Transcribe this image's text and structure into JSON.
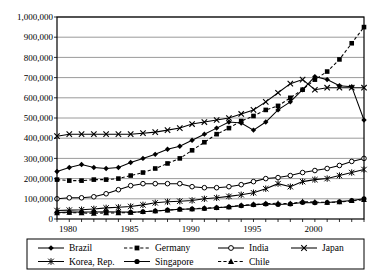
{
  "chart_data": {
    "type": "line",
    "title": "",
    "xlabel": "",
    "ylabel": "",
    "xlim": [
      1980,
      2005
    ],
    "ylim": [
      0,
      1000000
    ],
    "grid": true,
    "legend_position": "bottom",
    "x": [
      1980,
      1981,
      1982,
      1983,
      1984,
      1985,
      1986,
      1987,
      1988,
      1989,
      1990,
      1991,
      1992,
      1993,
      1994,
      1995,
      1996,
      1997,
      1998,
      1999,
      2000,
      2001,
      2002,
      2003,
      2004,
      2005
    ],
    "xtick_labels": [
      "1980",
      "1985",
      "1990",
      "1995",
      "2000"
    ],
    "xtick_values": [
      1980,
      1985,
      1990,
      1995,
      2000
    ],
    "ytick_labels": [
      "0",
      "100,000",
      "200,000",
      "300,000",
      "400,000",
      "500,000",
      "600,000",
      "700,000",
      "800,000",
      "900,000",
      "1,000,000"
    ],
    "ytick_values": [
      0,
      100000,
      200000,
      300000,
      400000,
      500000,
      600000,
      700000,
      800000,
      900000,
      1000000
    ],
    "series": [
      {
        "name": "Brazil",
        "marker": "diamond",
        "dash": "solid",
        "values": [
          235000,
          255000,
          270000,
          255000,
          250000,
          255000,
          280000,
          300000,
          320000,
          345000,
          360000,
          390000,
          420000,
          450000,
          480000,
          475000,
          440000,
          480000,
          540000,
          580000,
          640000,
          705000,
          690000,
          660000,
          655000,
          490000
        ]
      },
      {
        "name": "Germany",
        "marker": "square",
        "dash": "dashed",
        "values": [
          195000,
          190000,
          190000,
          195000,
          195000,
          200000,
          215000,
          230000,
          250000,
          275000,
          300000,
          340000,
          380000,
          420000,
          450000,
          485000,
          510000,
          540000,
          560000,
          600000,
          640000,
          690000,
          730000,
          790000,
          870000,
          950000
        ]
      },
      {
        "name": "India",
        "marker": "circle-open",
        "dash": "solid",
        "values": [
          100000,
          105000,
          105000,
          110000,
          125000,
          145000,
          165000,
          175000,
          175000,
          175000,
          175000,
          160000,
          155000,
          155000,
          160000,
          170000,
          185000,
          200000,
          205000,
          215000,
          230000,
          240000,
          250000,
          265000,
          285000,
          300000
        ]
      },
      {
        "name": "Japan",
        "marker": "x",
        "dash": "solid",
        "values": [
          410000,
          420000,
          420000,
          420000,
          420000,
          420000,
          420000,
          425000,
          430000,
          440000,
          450000,
          470000,
          480000,
          490000,
          500000,
          520000,
          540000,
          580000,
          625000,
          670000,
          690000,
          640000,
          650000,
          650000,
          650000,
          650000
        ]
      },
      {
        "name": "Korea, Rep.",
        "marker": "star",
        "dash": "solid",
        "values": [
          42000,
          44000,
          46000,
          50000,
          55000,
          58000,
          62000,
          70000,
          80000,
          85000,
          88000,
          92000,
          100000,
          105000,
          112000,
          120000,
          130000,
          150000,
          175000,
          160000,
          185000,
          195000,
          200000,
          215000,
          230000,
          245000
        ]
      },
      {
        "name": "Singapore",
        "marker": "circle-filled",
        "dash": "solid",
        "values": [
          32000,
          34000,
          35000,
          35000,
          36000,
          35000,
          34000,
          36000,
          40000,
          44000,
          48000,
          50000,
          52000,
          56000,
          60000,
          66000,
          70000,
          74000,
          72000,
          74000,
          82000,
          80000,
          82000,
          86000,
          92000,
          100000
        ]
      },
      {
        "name": "Chile",
        "marker": "triangle",
        "dash": "dashed",
        "values": [
          30000,
          32000,
          30000,
          28000,
          30000,
          30000,
          32000,
          36000,
          40000,
          44000,
          48000,
          50000,
          54000,
          56000,
          60000,
          68000,
          72000,
          76000,
          78000,
          76000,
          86000,
          84000,
          82000,
          84000,
          90000,
          95000
        ]
      }
    ]
  },
  "legend": {
    "entries": [
      {
        "label": "Brazil"
      },
      {
        "label": "Germany"
      },
      {
        "label": "India"
      },
      {
        "label": "Japan"
      },
      {
        "label": "Korea, Rep."
      },
      {
        "label": "Singapore"
      },
      {
        "label": "Chile"
      }
    ]
  },
  "style": {
    "line_color": "#000000",
    "grid_color": "#808080",
    "axis_color": "#000000",
    "background": "#ffffff"
  }
}
